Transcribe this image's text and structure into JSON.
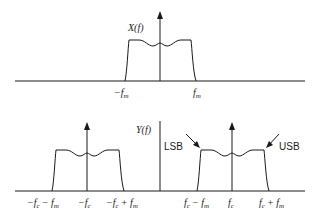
{
  "top_plot": {
    "ylabel": "X(f)",
    "ticks": [
      {
        "label": "−f",
        "sub": "m"
      },
      {
        "label": "f",
        "sub": "m"
      }
    ]
  },
  "bottom_plot": {
    "ylabel": "Y(f)",
    "left_ticks": [
      {
        "label": "−f",
        "sub": "c",
        "suffix": "− f",
        "sub2": "m"
      },
      {
        "label": "−f",
        "sub": "c"
      },
      {
        "label": "−f",
        "sub": "c",
        "suffix": "+ f",
        "sub2": "m"
      }
    ],
    "right_ticks": [
      {
        "label": "f",
        "sub": "c",
        "suffix": "− f",
        "sub2": "m"
      },
      {
        "label": "f",
        "sub": "c"
      },
      {
        "label": "f",
        "sub": "c",
        "suffix": "+ f",
        "sub2": "m"
      }
    ],
    "annotations": {
      "lsb": "LSB",
      "usb": "USB"
    }
  },
  "colors": {
    "line": "#1a1a1a",
    "background": "#ffffff"
  }
}
